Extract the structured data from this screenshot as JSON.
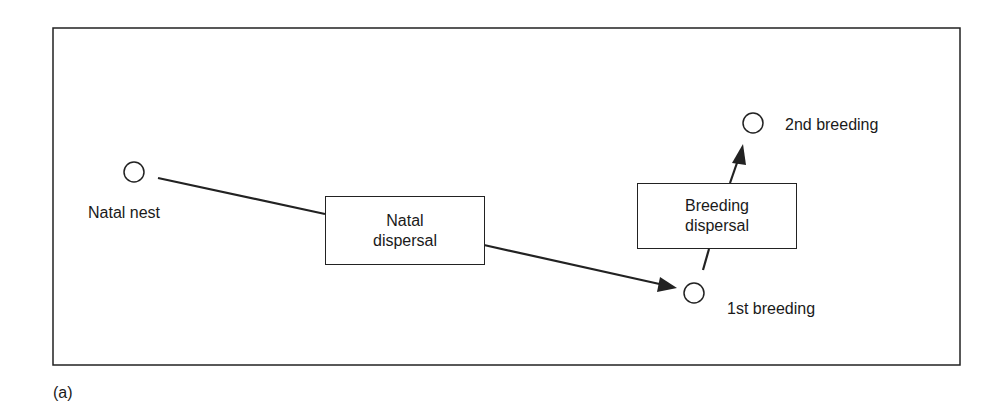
{
  "nodes": {
    "natal_nest": {
      "label": "Natal nest"
    },
    "first_breeding": {
      "label": "1st breeding"
    },
    "second_breeding": {
      "label": "2nd breeding"
    }
  },
  "boxes": {
    "natal_dispersal": {
      "line1": "Natal",
      "line2": "dispersal"
    },
    "breeding_dispersal": {
      "line1": "Breeding",
      "line2": "dispersal"
    }
  },
  "panel_label": "(a)",
  "colors": {
    "stroke": "#222222",
    "background": "#ffffff"
  }
}
